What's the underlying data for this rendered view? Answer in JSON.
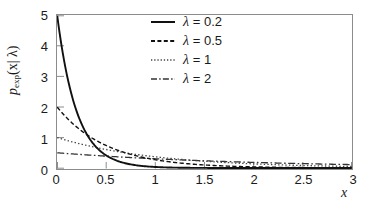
{
  "chart_data": {
    "type": "line",
    "title": "",
    "xlabel": "x",
    "ylabel": "p_exp(x| λ)",
    "ylabel_parts": {
      "base": "p",
      "sub": "exp",
      "arg": "(x| λ)"
    },
    "xlim": [
      0,
      3
    ],
    "ylim": [
      0,
      5
    ],
    "xticks": [
      0,
      0.5,
      1,
      1.5,
      2,
      2.5,
      3
    ],
    "xtick_labels": [
      "0",
      "0.5",
      "1",
      "1.5",
      "2",
      "2.5",
      "3"
    ],
    "yticks": [
      0,
      1,
      2,
      3,
      4,
      5
    ],
    "ytick_labels": [
      "0",
      "1",
      "2",
      "3",
      "4",
      "5"
    ],
    "grid": false,
    "legend_position": "top-right-inside",
    "formula": "p(x|lambda) = (1/lambda) * exp(-x/lambda)",
    "series": [
      {
        "name": "λ = 0.2",
        "lambda": 0.2,
        "linestyle": "solid",
        "color": "#111111",
        "y_intercept": 5,
        "x": [
          0,
          0.1,
          0.2,
          0.3,
          0.4,
          0.5,
          0.6,
          0.7,
          0.8,
          0.9,
          1.0,
          1.2,
          1.4,
          1.6,
          1.8,
          2.0,
          2.5,
          3.0
        ],
        "values": [
          5.0,
          3.033,
          1.839,
          1.116,
          0.677,
          0.41,
          0.249,
          0.151,
          0.092,
          0.055,
          0.034,
          0.012,
          0.005,
          0.002,
          0.001,
          0.0,
          0.0,
          0.0
        ]
      },
      {
        "name": "λ = 0.5",
        "lambda": 0.5,
        "linestyle": "dashed",
        "color": "#111111",
        "y_intercept": 2,
        "x": [
          0,
          0.1,
          0.2,
          0.3,
          0.4,
          0.5,
          0.6,
          0.7,
          0.8,
          0.9,
          1.0,
          1.2,
          1.4,
          1.6,
          1.8,
          2.0,
          2.5,
          3.0
        ],
        "values": [
          2.0,
          1.637,
          1.341,
          1.098,
          0.899,
          0.736,
          0.602,
          0.493,
          0.404,
          0.331,
          0.271,
          0.181,
          0.122,
          0.082,
          0.055,
          0.037,
          0.013,
          0.005
        ]
      },
      {
        "name": "λ = 1",
        "lambda": 1,
        "linestyle": "dotted",
        "color": "#444444",
        "y_intercept": 1,
        "x": [
          0,
          0.1,
          0.2,
          0.3,
          0.4,
          0.5,
          0.6,
          0.7,
          0.8,
          0.9,
          1.0,
          1.2,
          1.4,
          1.6,
          1.8,
          2.0,
          2.5,
          3.0
        ],
        "values": [
          1.0,
          0.905,
          0.819,
          0.741,
          0.67,
          0.607,
          0.549,
          0.497,
          0.449,
          0.407,
          0.368,
          0.301,
          0.247,
          0.202,
          0.165,
          0.135,
          0.082,
          0.05
        ]
      },
      {
        "name": "λ = 2",
        "lambda": 2,
        "linestyle": "dashdot",
        "color": "#333333",
        "y_intercept": 0.5,
        "x": [
          0,
          0.1,
          0.2,
          0.3,
          0.4,
          0.5,
          0.6,
          0.7,
          0.8,
          0.9,
          1.0,
          1.2,
          1.4,
          1.6,
          1.8,
          2.0,
          2.5,
          3.0
        ],
        "values": [
          0.5,
          0.476,
          0.452,
          0.43,
          0.409,
          0.389,
          0.37,
          0.352,
          0.335,
          0.319,
          0.303,
          0.274,
          0.248,
          0.225,
          0.203,
          0.184,
          0.143,
          0.112
        ]
      }
    ]
  },
  "legend": {
    "items": [
      {
        "label": "λ = 0.2",
        "lambda_symbol": "λ",
        "value": "= 0.2",
        "style": "solid"
      },
      {
        "label": "λ = 0.5",
        "lambda_symbol": "λ",
        "value": "= 0.5",
        "style": "dashed"
      },
      {
        "label": "λ = 1",
        "lambda_symbol": "λ",
        "value": "= 1",
        "style": "dotted"
      },
      {
        "label": "λ = 2",
        "lambda_symbol": "λ",
        "value": "= 2",
        "style": "dashdot"
      }
    ]
  }
}
